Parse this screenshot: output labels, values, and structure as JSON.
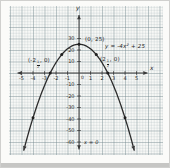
{
  "figure": {
    "type": "math-graph"
  },
  "chart_data": {
    "type": "line",
    "title": "",
    "equation_text": "y = -4x^2 + 25",
    "function": {
      "a": -4,
      "b": 0,
      "c": 25
    },
    "xlabel": "x",
    "ylabel": "y",
    "xlim": [
      -5.5,
      6.5
    ],
    "ylim": [
      -66,
      31
    ],
    "x_ticks": [
      -5,
      -4,
      -3,
      -2,
      -1,
      1,
      2,
      3,
      4,
      5
    ],
    "y_ticks": [
      30,
      20,
      10,
      -10,
      -20,
      -30,
      -40,
      -50,
      -60
    ],
    "origin_label": "0",
    "grid": true,
    "vertex": [
      0,
      25
    ],
    "x_intercepts": [
      -2.5,
      2.5
    ],
    "marked_points": [
      [
        0,
        25
      ],
      [
        -1.5,
        16
      ],
      [
        1.5,
        16
      ],
      [
        -2.5,
        0
      ],
      [
        2.5,
        0
      ],
      [
        -4,
        -39
      ],
      [
        4,
        -39
      ]
    ],
    "labels": {
      "vertex": "(0, 25)",
      "equation": {
        "pre": "y = -4x",
        "sup": "2",
        "post": " + 25"
      },
      "intercept_left": {
        "pre": "(-2",
        "frac_num": "1",
        "frac_den": "2",
        "post": ", 0)"
      },
      "intercept_right": {
        "pre": "(2",
        "frac_num": "1",
        "frac_den": "2",
        "post": ", 0)"
      },
      "axis_of_symmetry": "x = 0"
    }
  }
}
